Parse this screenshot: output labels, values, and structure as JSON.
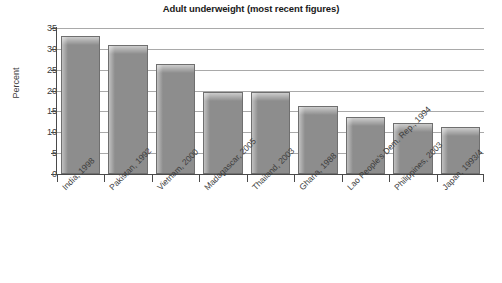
{
  "chart_data": {
    "type": "bar",
    "title": "Adult underweight (most recent figures)",
    "xlabel": "",
    "ylabel": "Percent",
    "ylim": [
      0,
      35
    ],
    "yticks": [
      0,
      5,
      10,
      15,
      20,
      25,
      30,
      35
    ],
    "grid": true,
    "legend": "none",
    "categories": [
      "India, 1998",
      "Pakistan, 1992",
      "Vietnam, 2000",
      "Madagascar, 2005",
      "Thailand, 2003",
      "Ghana, 1988",
      "Lao People's Dem. Rep., 1994",
      "Philippines, 2003",
      "Japan, 1993/4"
    ],
    "values": [
      33,
      31,
      26.3,
      19.6,
      19.6,
      16.2,
      13.6,
      12.2,
      11.3
    ],
    "bar_color": "#8d8d8d",
    "bar_border_color": "#6f6f6f",
    "gridline_color": "#a9a9a9",
    "axis_color": "#4a4a4a"
  }
}
